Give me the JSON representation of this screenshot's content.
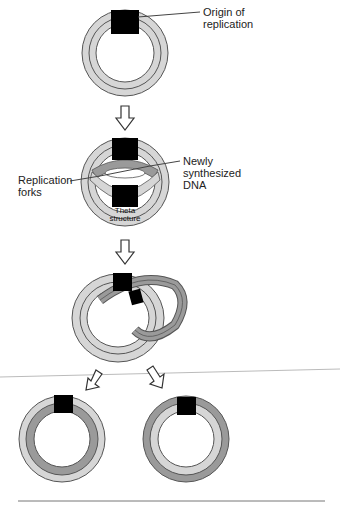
{
  "labels": {
    "origin_line1": "Origin of",
    "origin_line2": "replication",
    "forks_line1": "Replication",
    "forks_line2": "forks",
    "new_line1": "Newly",
    "new_line2": "synthesized",
    "new_line3": "DNA",
    "theta_line1": "Theta",
    "theta_line2": "structure"
  },
  "colors": {
    "light_strand": "#d6d6d6",
    "dark_strand": "#9a9a9a",
    "origin": "#000000",
    "outline": "#555555"
  },
  "stages": [
    {
      "name": "parental circular DNA"
    },
    {
      "name": "theta structure"
    },
    {
      "name": "interlocked daughter molecules"
    },
    {
      "name": "daughter molecule 1"
    },
    {
      "name": "daughter molecule 2"
    }
  ]
}
